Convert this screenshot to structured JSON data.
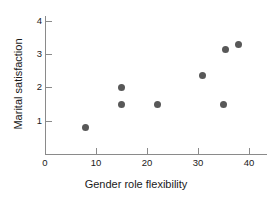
{
  "chart_data": {
    "type": "scatter",
    "title": "",
    "xlabel": "Gender role flexibility",
    "ylabel": "Marital satisfaction",
    "xlim": [
      0,
      43.5
    ],
    "ylim": [
      0,
      4.15
    ],
    "grid": false,
    "legend": null,
    "xticks": [
      {
        "value": 0,
        "label": "0"
      },
      {
        "value": 10,
        "label": "10"
      },
      {
        "value": 20,
        "label": "20"
      },
      {
        "value": 30,
        "label": "30"
      },
      {
        "value": 40,
        "label": "40"
      }
    ],
    "yticks": [
      {
        "value": 1,
        "label": "1"
      },
      {
        "value": 2,
        "label": "2"
      },
      {
        "value": 3,
        "label": "3"
      },
      {
        "value": 4,
        "label": "4"
      }
    ],
    "marker": {
      "shape": "circle",
      "color": "#585858",
      "size": 7
    },
    "points": [
      {
        "x": 8,
        "y": 0.8
      },
      {
        "x": 15,
        "y": 2.0
      },
      {
        "x": 15,
        "y": 1.5
      },
      {
        "x": 22,
        "y": 1.5
      },
      {
        "x": 30.8,
        "y": 2.35
      },
      {
        "x": 35,
        "y": 1.5
      },
      {
        "x": 35.4,
        "y": 3.15
      },
      {
        "x": 38,
        "y": 3.3
      }
    ]
  }
}
